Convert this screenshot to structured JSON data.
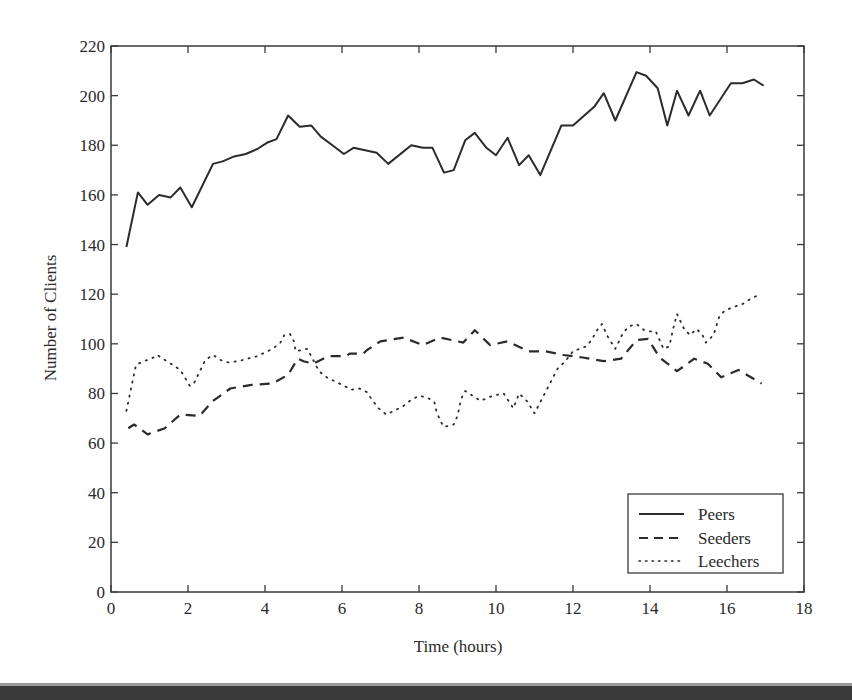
{
  "chart_data": {
    "type": "line",
    "title": "",
    "xlabel": "Time (hours)",
    "ylabel": "Number of Clients",
    "xlim": [
      0,
      18
    ],
    "ylim": [
      0,
      220
    ],
    "xticks": [
      0,
      2,
      4,
      6,
      8,
      10,
      12,
      14,
      16,
      18
    ],
    "yticks": [
      0,
      20,
      40,
      60,
      80,
      100,
      120,
      140,
      160,
      180,
      200,
      220
    ],
    "grid": false,
    "legend_position": "lower right",
    "series": [
      {
        "name": "Peers",
        "style": "solid",
        "x": [
          0.4,
          0.7,
          0.95,
          1.25,
          1.55,
          1.8,
          2.1,
          2.65,
          2.9,
          3.2,
          3.5,
          3.8,
          4.05,
          4.3,
          4.6,
          4.9,
          5.2,
          5.45,
          5.75,
          6.05,
          6.3,
          6.6,
          6.9,
          7.2,
          7.8,
          8.1,
          8.35,
          8.65,
          8.9,
          9.2,
          9.45,
          9.75,
          10.0,
          10.3,
          10.6,
          10.85,
          11.15,
          11.7,
          12.0,
          12.55,
          12.8,
          13.1,
          13.65,
          13.9,
          14.2,
          14.45,
          14.7,
          15.0,
          15.3,
          15.55,
          16.1,
          16.4,
          16.7,
          16.95
        ],
        "values": [
          139,
          161,
          156,
          160,
          159,
          163,
          155,
          172.5,
          173.5,
          175.5,
          176.5,
          178.5,
          181,
          182.5,
          192,
          187.5,
          188,
          183.5,
          180,
          176.5,
          179,
          178,
          177,
          172.5,
          180,
          179,
          179,
          169,
          170,
          182,
          185,
          179,
          176,
          183,
          172,
          176,
          168,
          188,
          188,
          195.5,
          201,
          190,
          209.5,
          208,
          203,
          188,
          202,
          192,
          202,
          192,
          205,
          205,
          206.5,
          204
        ]
      },
      {
        "name": "Seeders",
        "style": "dashed",
        "x": [
          0.45,
          0.6,
          0.95,
          1.4,
          1.8,
          2.3,
          2.65,
          3.1,
          3.65,
          4.2,
          4.6,
          4.85,
          5.0,
          5.25,
          5.65,
          6.1,
          6.2,
          6.55,
          6.65,
          7.0,
          7.6,
          8.1,
          8.55,
          9.15,
          9.45,
          9.85,
          10.3,
          10.85,
          11.3,
          11.75,
          12.25,
          12.8,
          13.25,
          13.65,
          13.95,
          14.25,
          14.7,
          15.15,
          15.5,
          15.85,
          16.3,
          16.9
        ],
        "values": [
          66,
          67.5,
          63.5,
          66,
          71.5,
          71,
          77,
          82,
          83.5,
          84,
          87.5,
          94,
          93,
          92,
          95,
          95,
          96,
          96,
          97.5,
          101,
          102.5,
          99.5,
          102.5,
          100.5,
          105.5,
          99.5,
          101,
          97,
          97,
          95.5,
          94.5,
          93,
          94,
          101.5,
          102,
          94.5,
          89,
          94,
          92,
          86.5,
          89.5,
          84
        ]
      },
      {
        "name": "Leechers",
        "style": "dotted",
        "x": [
          0.4,
          0.65,
          0.85,
          1.05,
          1.2,
          1.45,
          1.6,
          1.8,
          2.05,
          2.15,
          2.45,
          2.65,
          2.85,
          3.05,
          3.3,
          3.55,
          3.8,
          4.0,
          4.2,
          4.4,
          4.5,
          4.65,
          4.75,
          4.8,
          5.1,
          5.4,
          5.6,
          5.8,
          6.0,
          6.25,
          6.45,
          6.65,
          6.8,
          6.95,
          7.15,
          7.35,
          7.6,
          7.8,
          8.0,
          8.2,
          8.4,
          8.45,
          8.55,
          8.65,
          8.9,
          9.0,
          9.05,
          9.1,
          9.2,
          9.4,
          9.6,
          9.9,
          10.2,
          10.45,
          10.6,
          10.8,
          11.0,
          11.2,
          11.4,
          11.6,
          11.8,
          12.0,
          12.35,
          12.5,
          12.6,
          12.75,
          12.9,
          13.1,
          13.3,
          13.45,
          13.65,
          13.85,
          14.0,
          14.15,
          14.35,
          14.5,
          14.6,
          14.7,
          14.9,
          15.05,
          15.2,
          15.35,
          15.45,
          15.65,
          15.8,
          15.95,
          16.2,
          16.4,
          16.6,
          16.8
        ],
        "values": [
          73,
          91.5,
          93,
          94,
          95.5,
          93,
          91.5,
          89.5,
          83,
          84,
          93.5,
          95.5,
          93.5,
          92.5,
          93,
          94,
          95,
          96.5,
          98,
          100.5,
          103.5,
          104,
          101,
          97,
          98,
          89,
          86.5,
          85,
          83.5,
          81.5,
          82,
          80.5,
          77,
          74,
          71.5,
          73,
          75,
          77.5,
          79,
          78.5,
          76.5,
          73,
          69,
          66.5,
          67.5,
          71,
          74.5,
          78,
          81,
          79,
          77,
          79,
          80,
          74,
          80,
          77,
          72,
          78,
          84,
          90,
          93,
          97,
          99,
          102,
          105,
          108,
          103,
          98,
          104.5,
          107,
          108,
          105.5,
          105,
          105,
          98,
          99,
          106,
          112,
          105.5,
          103.5,
          106,
          104,
          100.5,
          103.5,
          111,
          113.5,
          115,
          116,
          118,
          119.5
        ]
      }
    ]
  },
  "axes": {
    "xlabel": "Time (hours)",
    "ylabel": "Number of Clients",
    "xtick_labels": [
      "0",
      "2",
      "4",
      "6",
      "8",
      "10",
      "12",
      "14",
      "16",
      "18"
    ],
    "ytick_labels": [
      "0",
      "20",
      "40",
      "60",
      "80",
      "100",
      "120",
      "140",
      "160",
      "180",
      "200",
      "220"
    ]
  },
  "legend": {
    "items": [
      {
        "label": "Peers",
        "style": "solid"
      },
      {
        "label": "Seeders",
        "style": "dashed"
      },
      {
        "label": "Leechers",
        "style": "dotted"
      }
    ]
  },
  "colors": {
    "line": "#2b2b2b",
    "axis": "#3a3a3a",
    "background": "#ffffff",
    "bottom_bar": "#3a3a3a"
  }
}
